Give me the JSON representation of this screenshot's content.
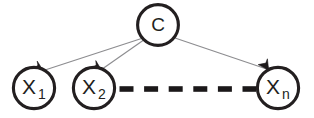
{
  "diagram": {
    "type": "directed-graph",
    "background_color": "#ffffff",
    "node_stroke_color": "#231f20",
    "edge_color": "#8d8d90",
    "dash_color": "#1b1819",
    "nodes": [
      {
        "id": "C",
        "label": "C",
        "subscript": "",
        "cx": 158,
        "cy": 25,
        "r": 21,
        "role": "class-node"
      },
      {
        "id": "X1",
        "label": "X",
        "subscript": "1",
        "cx": 34,
        "cy": 88,
        "r": 21,
        "role": "attribute-node"
      },
      {
        "id": "X2",
        "label": "X",
        "subscript": "2",
        "cx": 94,
        "cy": 88,
        "r": 21,
        "role": "attribute-node"
      },
      {
        "id": "Xn",
        "label": "X",
        "subscript": "n",
        "cx": 278,
        "cy": 88,
        "r": 21,
        "role": "attribute-node"
      }
    ],
    "edges": [
      {
        "from": "C",
        "to": "X1",
        "style": "solid-arrow"
      },
      {
        "from": "C",
        "to": "X2",
        "style": "solid-arrow"
      },
      {
        "from": "C",
        "to": "Xn",
        "style": "solid-arrow"
      }
    ],
    "ellipsis": {
      "between": [
        "X2",
        "Xn"
      ],
      "style": "thick-dashed",
      "dash_count": 6,
      "y": 89,
      "x_start": 119,
      "x_end": 256,
      "dash_length": 14,
      "gap_length": 10.6
    }
  }
}
